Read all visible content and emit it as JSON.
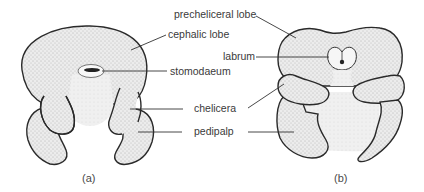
{
  "figure_a": {
    "caption": "(a)",
    "labels": {
      "cephalic_lobe": "cephalic lobe",
      "stomodaeum": "stomodaeum",
      "chelicera": "chelicera",
      "pedipalp": "pedipalp"
    }
  },
  "figure_b": {
    "caption": "(b)",
    "labels": {
      "precheliceral_lobe": "precheliceral lobe",
      "labrum": "labrum"
    }
  },
  "colors": {
    "fill": "#e6e6e6",
    "fill_light": "#efefef",
    "outline": "#2a2a2a",
    "text": "#3a3a3a"
  }
}
